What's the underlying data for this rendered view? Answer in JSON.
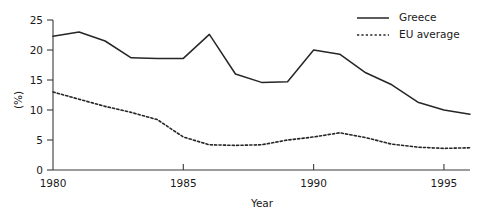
{
  "chart_data": {
    "type": "line",
    "title": "",
    "xlabel": "Year",
    "ylabel": "(%)",
    "xlim": [
      1980,
      1996
    ],
    "ylim": [
      0,
      25
    ],
    "grid": false,
    "legend_position": "top-right",
    "x": [
      1980,
      1981,
      1982,
      1983,
      1984,
      1985,
      1986,
      1987,
      1988,
      1989,
      1990,
      1991,
      1992,
      1993,
      1994,
      1995,
      1996
    ],
    "xticks": [
      1980,
      1985,
      1990,
      1995
    ],
    "xtick_labels": [
      "1980",
      "1985",
      "1990",
      "1995"
    ],
    "yticks": [
      0,
      5,
      10,
      15,
      20,
      25
    ],
    "ytick_labels": [
      "0",
      "5",
      "10",
      "15",
      "20",
      "25"
    ],
    "series": [
      {
        "name": "Greece",
        "style": "solid",
        "color": "#262626",
        "values": [
          22.3,
          23.0,
          21.5,
          18.7,
          18.6,
          18.6,
          22.6,
          16.0,
          14.6,
          14.7,
          20.0,
          19.3,
          16.2,
          14.2,
          11.3,
          10.0,
          9.3
        ]
      },
      {
        "name": "EU average",
        "style": "dashed",
        "color": "#262626",
        "values": [
          13.0,
          11.8,
          10.6,
          9.6,
          8.4,
          5.5,
          4.2,
          4.1,
          4.2,
          5.0,
          5.5,
          6.2,
          5.4,
          4.3,
          3.8,
          3.6,
          3.7
        ]
      }
    ]
  },
  "axes": {
    "y_title": "(%)",
    "x_title": "Year"
  },
  "legend": {
    "items": [
      {
        "label": "Greece",
        "style": "solid"
      },
      {
        "label": "EU average",
        "style": "dashed"
      }
    ]
  }
}
